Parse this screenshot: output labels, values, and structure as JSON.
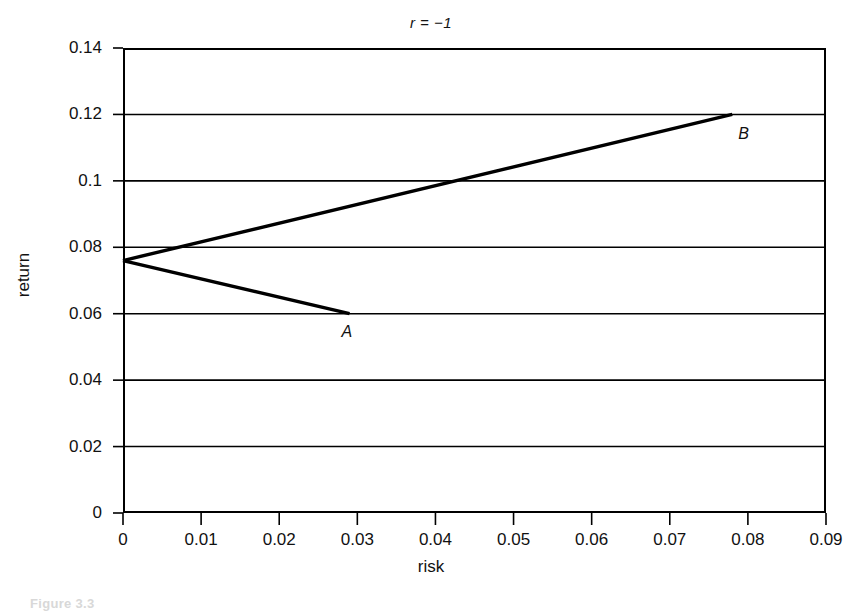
{
  "figure": {
    "caption_fragment": "Figure 3.3"
  },
  "chart_data": {
    "type": "line",
    "title": "r = −1",
    "xlabel": "risk",
    "ylabel": "return",
    "xlim": [
      0,
      0.09
    ],
    "ylim": [
      0,
      0.14
    ],
    "grid": "horizontal",
    "legend": "none",
    "xticks": [
      0,
      0.01,
      0.02,
      0.03,
      0.04,
      0.05,
      0.06,
      0.07,
      0.08,
      0.09
    ],
    "xticklabels": [
      "0",
      "0.01",
      "0.02",
      "0.03",
      "0.04",
      "0.05",
      "0.06",
      "0.07",
      "0.08",
      "0.09"
    ],
    "yticks": [
      0,
      0.02,
      0.04,
      0.06,
      0.08,
      0.1,
      0.12,
      0.14
    ],
    "yticklabels": [
      "0",
      "0.02",
      "0.04",
      "0.06",
      "0.08",
      "0.1",
      "0.12",
      "0.14"
    ],
    "series": [
      {
        "name": "segment-to-A",
        "x": [
          0,
          0.029
        ],
        "y": [
          0.076,
          0.06
        ]
      },
      {
        "name": "segment-to-B",
        "x": [
          0,
          0.078
        ],
        "y": [
          0.076,
          0.12
        ]
      }
    ],
    "annotations": [
      {
        "text": "A",
        "x": 0.029,
        "y": 0.06,
        "label_offset": "below-left"
      },
      {
        "text": "B",
        "x": 0.078,
        "y": 0.12,
        "label_offset": "below-right"
      }
    ],
    "vertex": {
      "x": 0,
      "y": 0.076,
      "description": "zero-risk minimum variance point"
    },
    "crossing": {
      "x": 0.0425,
      "y": 0.1
    },
    "line_color": "#000000"
  }
}
